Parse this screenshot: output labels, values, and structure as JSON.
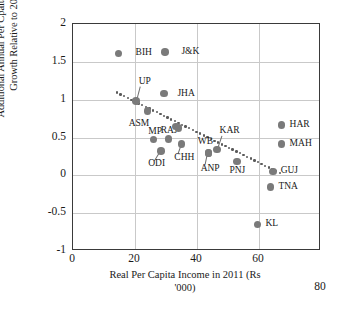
{
  "chart_data": {
    "type": "scatter",
    "title": "",
    "xlabel": "Real Per Capita Income in 2011 (Rs\n'000)",
    "ylabel": "Additional Annual Per Cpaita Income\nGrowth Relative to 2011",
    "xlim": [
      0,
      80
    ],
    "ylim": [
      -1,
      2
    ],
    "xticks": [
      "0",
      "20",
      "40",
      "60",
      "80"
    ],
    "xtick_values": [
      0,
      20,
      40,
      60,
      80
    ],
    "yticks": [
      "2",
      "1.5",
      "1",
      "0.5",
      "0",
      "-0.5",
      "-1"
    ],
    "ytick_values": [
      2,
      1.5,
      1,
      0.5,
      0,
      -0.5,
      -1
    ],
    "grid": true,
    "legend": "none",
    "marker_color": "#7a7a7a",
    "trendline_color": "#5a5a5a",
    "axis_color": "#3a3a3a",
    "points": [
      {
        "label": "BIH",
        "x": 15.0,
        "y": 1.6,
        "lx": 20.5,
        "ly": 1.6,
        "anchor": "left"
      },
      {
        "label": "J&K",
        "x": 30.0,
        "y": 1.62,
        "lx": 35.3,
        "ly": 1.62,
        "anchor": "left"
      },
      {
        "label": "UP",
        "x": 20.6,
        "y": 0.97,
        "lx": 21.5,
        "ly": 1.22,
        "anchor": "left"
      },
      {
        "label": "JHA",
        "x": 29.6,
        "y": 1.07,
        "lx": 34.0,
        "ly": 1.06,
        "anchor": "left"
      },
      {
        "label": "ASM",
        "x": 24.3,
        "y": 0.84,
        "lx": 18.3,
        "ly": 0.66,
        "anchor": "left"
      },
      {
        "label": "MP",
        "x": 26.3,
        "y": 0.46,
        "lx": 24.6,
        "ly": 0.56,
        "anchor": "left"
      },
      {
        "label": "RAJ",
        "x": 31.2,
        "y": 0.47,
        "lx": 28.6,
        "ly": 0.57,
        "anchor": "left"
      },
      {
        "label": "",
        "x": 33.6,
        "y": 0.63,
        "lx": 0,
        "ly": 0,
        "anchor": "none"
      },
      {
        "label": "",
        "x": 34.4,
        "y": 0.61,
        "lx": 0,
        "ly": 0,
        "anchor": "none"
      },
      {
        "label": "ODI",
        "x": 28.7,
        "y": 0.31,
        "lx": 24.6,
        "ly": 0.14,
        "anchor": "left"
      },
      {
        "label": "CHH",
        "x": 35.4,
        "y": 0.4,
        "lx": 33.0,
        "ly": 0.21,
        "anchor": "left"
      },
      {
        "label": "WB",
        "x": 44.0,
        "y": 0.28,
        "lx": 40.6,
        "ly": 0.43,
        "anchor": "left"
      },
      {
        "label": "KAR",
        "x": 46.8,
        "y": 0.33,
        "lx": 47.6,
        "ly": 0.57,
        "anchor": "left"
      },
      {
        "label": "ANP",
        "x": 44.0,
        "y": 0.28,
        "lx": 41.5,
        "ly": 0.07,
        "anchor": "left"
      },
      {
        "label": "PNJ",
        "x": 53.2,
        "y": 0.17,
        "lx": 50.8,
        "ly": 0.05,
        "anchor": "left"
      },
      {
        "label": "GUJ",
        "x": 64.8,
        "y": 0.04,
        "lx": 67.3,
        "ly": 0.05,
        "anchor": "left"
      },
      {
        "label": "HAR",
        "x": 67.6,
        "y": 0.65,
        "lx": 70.2,
        "ly": 0.65,
        "anchor": "left"
      },
      {
        "label": "MAH",
        "x": 67.6,
        "y": 0.4,
        "lx": 70.2,
        "ly": 0.4,
        "anchor": "left"
      },
      {
        "label": "TNA",
        "x": 64.0,
        "y": -0.17,
        "lx": 66.6,
        "ly": -0.17,
        "anchor": "left"
      },
      {
        "label": "KL",
        "x": 59.8,
        "y": -0.66,
        "lx": 62.4,
        "ly": -0.66,
        "anchor": "left"
      }
    ],
    "leaders": [
      {
        "from_x": 28.7,
        "from_y": 0.31,
        "to_x": 26.6,
        "to_y": 0.17
      },
      {
        "from_x": 35.4,
        "from_y": 0.4,
        "to_x": 34.2,
        "to_y": 0.26
      },
      {
        "from_x": 46.8,
        "from_y": 0.33,
        "to_x": 48.2,
        "to_y": 0.5
      },
      {
        "from_x": 44.0,
        "from_y": 0.28,
        "to_x": 43.2,
        "to_y": 0.12
      },
      {
        "from_x": 20.6,
        "from_y": 0.97,
        "to_x": 21.8,
        "to_y": 1.16
      }
    ],
    "trendline": {
      "style": "dotted",
      "x_start": 14.5,
      "y_start": 1.08,
      "x_end": 67.0,
      "y_end": 0.02,
      "n_dots": 46
    }
  }
}
